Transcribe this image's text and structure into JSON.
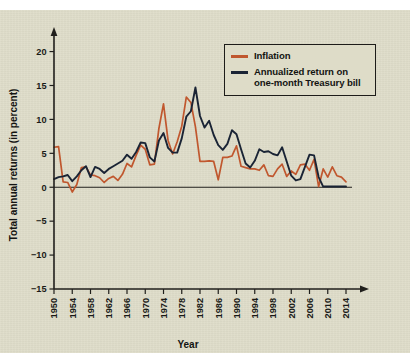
{
  "chart_data": {
    "type": "line",
    "title": "",
    "xlabel": "Year",
    "ylabel": "Total annual returns (in percent)",
    "xlim": [
      1950,
      2014
    ],
    "ylim": [
      -15,
      22
    ],
    "yticks": [
      "20",
      "15",
      "10",
      "5",
      "0",
      "−5",
      "−10",
      "−15"
    ],
    "ytick_values": [
      20,
      15,
      10,
      5,
      0,
      -5,
      -10,
      -15
    ],
    "xticks": [
      "1950",
      "1954",
      "1958",
      "1962",
      "1966",
      "1970",
      "1974",
      "1978",
      "1982",
      "1986",
      "1990",
      "1994",
      "1998",
      "2002",
      "2006",
      "2010",
      "2014"
    ],
    "xtick_values": [
      1950,
      1954,
      1958,
      1962,
      1966,
      1970,
      1974,
      1978,
      1982,
      1986,
      1990,
      1994,
      1998,
      2002,
      2006,
      2010,
      2014
    ],
    "grid": false,
    "legend_position": "top-right",
    "x": [
      1950,
      1951,
      1952,
      1953,
      1954,
      1955,
      1956,
      1957,
      1958,
      1959,
      1960,
      1961,
      1962,
      1963,
      1964,
      1965,
      1966,
      1967,
      1968,
      1969,
      1970,
      1971,
      1972,
      1973,
      1974,
      1975,
      1976,
      1977,
      1978,
      1979,
      1980,
      1981,
      1982,
      1983,
      1984,
      1985,
      1986,
      1987,
      1988,
      1989,
      1990,
      1991,
      1992,
      1993,
      1994,
      1995,
      1996,
      1997,
      1998,
      1999,
      2000,
      2001,
      2002,
      2003,
      2004,
      2005,
      2006,
      2007,
      2008,
      2009,
      2010,
      2011,
      2012,
      2013,
      2014
    ],
    "series": [
      {
        "name": "Inflation",
        "color": "#c0572e",
        "values": [
          5.9,
          6.0,
          0.8,
          0.7,
          -0.7,
          0.4,
          2.9,
          3.0,
          1.8,
          1.7,
          1.4,
          0.7,
          1.3,
          1.6,
          1.0,
          1.9,
          3.5,
          3.0,
          4.7,
          6.2,
          5.6,
          3.3,
          3.4,
          8.7,
          12.3,
          6.9,
          4.9,
          6.7,
          9.0,
          13.3,
          12.5,
          8.9,
          3.8,
          3.8,
          3.9,
          3.8,
          1.1,
          4.4,
          4.4,
          4.6,
          6.1,
          3.1,
          2.9,
          2.7,
          2.7,
          2.5,
          3.3,
          1.7,
          1.6,
          2.7,
          3.4,
          1.6,
          2.4,
          1.9,
          3.3,
          3.4,
          2.5,
          4.1,
          0.1,
          2.7,
          1.5,
          3.0,
          1.7,
          1.5,
          0.8
        ]
      },
      {
        "name": "Annualized return on one-month Treasury bill",
        "color": "#1a2435",
        "values": [
          1.2,
          1.5,
          1.6,
          1.8,
          0.9,
          1.6,
          2.5,
          3.1,
          1.5,
          3.0,
          2.7,
          2.1,
          2.7,
          3.1,
          3.5,
          3.9,
          4.8,
          4.2,
          5.2,
          6.6,
          6.5,
          4.4,
          3.8,
          6.9,
          8.0,
          5.8,
          5.1,
          5.1,
          7.2,
          10.4,
          11.2,
          14.7,
          10.5,
          8.8,
          9.8,
          7.7,
          6.2,
          5.5,
          6.4,
          8.4,
          7.8,
          5.6,
          3.5,
          2.9,
          3.9,
          5.6,
          5.2,
          5.3,
          4.9,
          4.7,
          5.9,
          3.8,
          1.7,
          1.0,
          1.2,
          3.0,
          4.8,
          4.7,
          1.5,
          0.1,
          0.1,
          0.1,
          0.1,
          0.1,
          0.1
        ]
      }
    ]
  },
  "legend": {
    "items": [
      {
        "label": "Inflation",
        "color": "#c0572e"
      },
      {
        "label": "Annualized return on\none-month Treasury bill",
        "color": "#1a2435"
      }
    ]
  },
  "axes": {
    "y_title": "Total annual returns (in percent)",
    "x_title": "Year"
  }
}
